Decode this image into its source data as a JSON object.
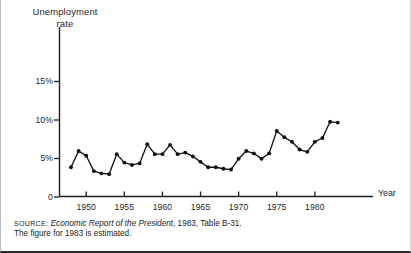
{
  "figure": {
    "y_axis_title": "Unemployment\nrate",
    "x_axis_title": "Year"
  },
  "source": {
    "label": "SOURCE:",
    "reference_italic": "Economic Report of the President",
    "reference_rest": ", 1983, Table B-31.",
    "note": "The figure for 1983 is estimated."
  },
  "chart_data": {
    "type": "line",
    "title": "",
    "subtitle": "",
    "xlabel": "Year",
    "ylabel": "Unemployment rate",
    "xlim": [
      1947,
      1984
    ],
    "ylim": [
      0,
      17
    ],
    "grid": false,
    "legend": null,
    "y_ticks": [
      0,
      5,
      10,
      15
    ],
    "y_tick_labels": [
      "0",
      "5%",
      "10%",
      "15%"
    ],
    "x_ticks": [
      1950,
      1955,
      1960,
      1965,
      1970,
      1975,
      1980
    ],
    "x_tick_labels": [
      "1950",
      "1955",
      "1960",
      "1965",
      "1970",
      "1975",
      "1980"
    ],
    "marker": "filled-circle",
    "line_color": "#111111",
    "x": [
      1948,
      1949,
      1950,
      1951,
      1952,
      1953,
      1954,
      1955,
      1956,
      1957,
      1958,
      1959,
      1960,
      1961,
      1962,
      1963,
      1964,
      1965,
      1966,
      1967,
      1968,
      1969,
      1970,
      1971,
      1972,
      1973,
      1974,
      1975,
      1976,
      1977,
      1978,
      1979,
      1980,
      1981,
      1982,
      1983
    ],
    "values": [
      3.8,
      5.9,
      5.3,
      3.3,
      3.0,
      2.9,
      5.5,
      4.4,
      4.1,
      4.3,
      6.8,
      5.5,
      5.5,
      6.7,
      5.5,
      5.7,
      5.2,
      4.5,
      3.8,
      3.8,
      3.6,
      3.5,
      4.9,
      5.9,
      5.6,
      4.9,
      5.6,
      8.5,
      7.7,
      7.1,
      6.1,
      5.8,
      7.1,
      7.6,
      9.7,
      9.6
    ],
    "series": [
      {
        "name": "Unemployment rate",
        "values": [
          3.8,
          5.9,
          5.3,
          3.3,
          3.0,
          2.9,
          5.5,
          4.4,
          4.1,
          4.3,
          6.8,
          5.5,
          5.5,
          6.7,
          5.5,
          5.7,
          5.2,
          4.5,
          3.8,
          3.8,
          3.6,
          3.5,
          4.9,
          5.9,
          5.6,
          4.9,
          5.6,
          8.5,
          7.7,
          7.1,
          6.1,
          5.8,
          7.1,
          7.6,
          9.7,
          9.6
        ]
      }
    ]
  }
}
